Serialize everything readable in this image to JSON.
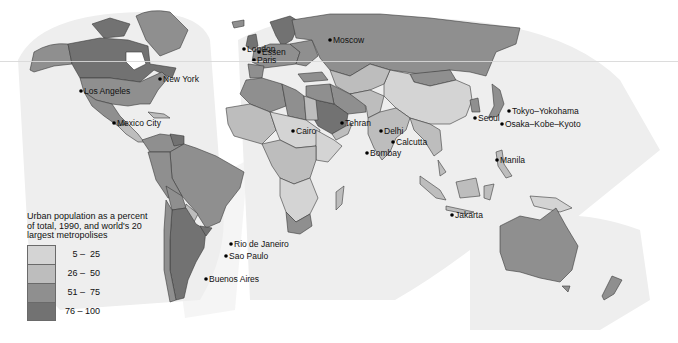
{
  "legend": {
    "title_lines": [
      "Urban population as a percent",
      "of total, 1990, and world's 20",
      "largest metropolises"
    ],
    "classes": [
      {
        "label": "5 –  25",
        "color": "#d4d4d4"
      },
      {
        "label": "26 –  50",
        "color": "#bdbdbd"
      },
      {
        "label": "51 –  75",
        "color": "#8f8f8f"
      },
      {
        "label": "76 – 100",
        "color": "#727272"
      }
    ]
  },
  "cities": [
    {
      "name": "London",
      "x": 247,
      "y": 45
    },
    {
      "name": "Essen",
      "x": 262,
      "y": 48
    },
    {
      "name": "Paris",
      "x": 257,
      "y": 56
    },
    {
      "name": "Moscow",
      "x": 333,
      "y": 36
    },
    {
      "name": "New York",
      "x": 163,
      "y": 75
    },
    {
      "name": "Los Angeles",
      "x": 84,
      "y": 87
    },
    {
      "name": "Mexico City",
      "x": 117,
      "y": 119
    },
    {
      "name": "Cairo",
      "x": 296,
      "y": 127
    },
    {
      "name": "Tehran",
      "x": 345,
      "y": 119
    },
    {
      "name": "Delhi",
      "x": 384,
      "y": 127
    },
    {
      "name": "Calcutta",
      "x": 396,
      "y": 138
    },
    {
      "name": "Bombay",
      "x": 370,
      "y": 149
    },
    {
      "name": "Seoul",
      "x": 478,
      "y": 114
    },
    {
      "name": "Tokyo–Yokohama",
      "x": 512,
      "y": 107
    },
    {
      "name": "Osaka–Kobe–Kyoto",
      "x": 505,
      "y": 120
    },
    {
      "name": "Manila",
      "x": 500,
      "y": 156
    },
    {
      "name": "Jakarta",
      "x": 455,
      "y": 211
    },
    {
      "name": "Rio de Janeiro",
      "x": 234,
      "y": 240
    },
    {
      "name": "Sao Paulo",
      "x": 229,
      "y": 252
    },
    {
      "name": "Buenos Aires",
      "x": 209,
      "y": 275
    }
  ],
  "colors": {
    "background": "#ffffff",
    "lobe": "#eeeeee",
    "ocean_band": "#f4f4f4",
    "border": "#3a3a3a"
  }
}
